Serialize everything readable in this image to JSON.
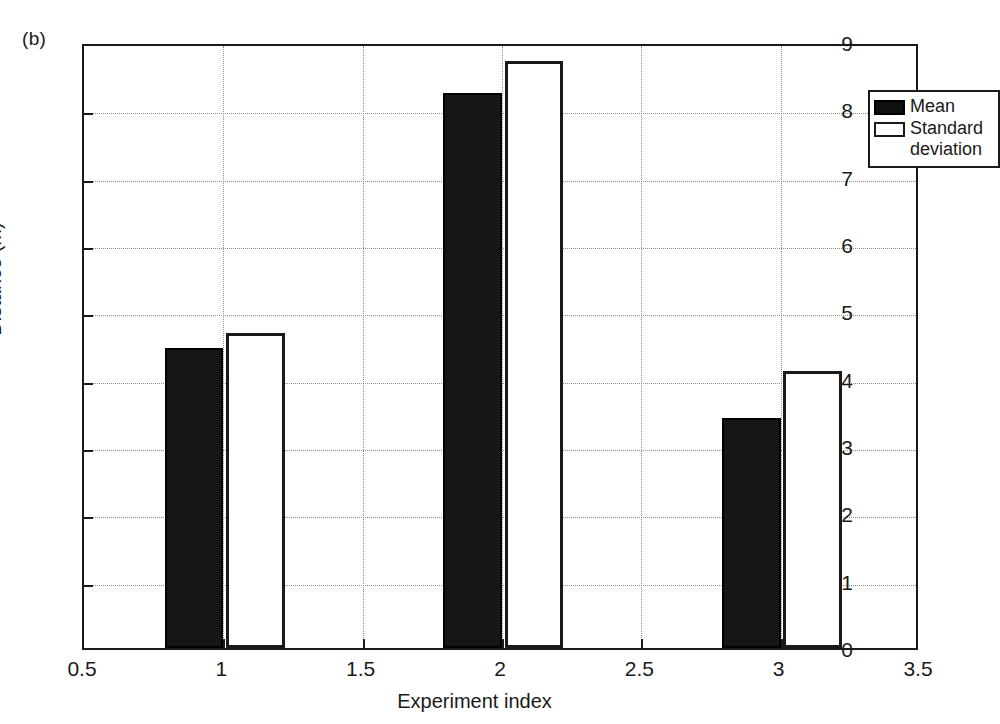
{
  "panel_label": "(b)",
  "legend": {
    "items": [
      {
        "label": "Mean",
        "swatch": "filled-black-square",
        "color": "#0f0f0f"
      },
      {
        "label": "Standard\ndeviation",
        "swatch": "hollow-white-square",
        "color": "#ffffff"
      }
    ]
  },
  "axes": {
    "x_title": "Experiment index",
    "y_title": "Distance (m)",
    "x_ticks": [
      "0.5",
      "1",
      "1.5",
      "2",
      "2.5",
      "3",
      "3.5"
    ],
    "y_ticks": [
      "0",
      "1",
      "2",
      "3",
      "4",
      "5",
      "6",
      "7",
      "8",
      "9"
    ]
  },
  "chart_data": {
    "type": "bar",
    "title": "",
    "subtitle": "",
    "xlabel": "Experiment index",
    "ylabel": "Distance (m)",
    "xlim": [
      0.5,
      3.5
    ],
    "ylim": [
      0,
      9
    ],
    "xticks": [
      0.5,
      1,
      1.5,
      2,
      2.5,
      3,
      3.5
    ],
    "yticks": [
      0,
      1,
      2,
      3,
      4,
      5,
      6,
      7,
      8,
      9
    ],
    "grid": true,
    "legend_position": "top-right",
    "categories": [
      1,
      2,
      3
    ],
    "bar_width": 0.21,
    "series": [
      {
        "name": "Mean",
        "fill": "#0f0f0f",
        "edge": "#000000",
        "offset": -0.105,
        "values": [
          4.45,
          8.25,
          3.42
        ]
      },
      {
        "name": "Standard deviation",
        "fill": "#ffffff",
        "edge": "#1a1a1a",
        "offset": 0.115,
        "values": [
          4.68,
          8.72,
          4.11
        ]
      }
    ],
    "annotations": [
      "(b)"
    ]
  }
}
